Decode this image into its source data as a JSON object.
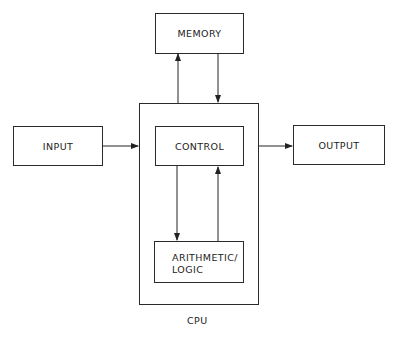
{
  "diagram": {
    "type": "block-diagram",
    "nodes": {
      "memory": {
        "label": "MEMORY"
      },
      "input": {
        "label": "INPUT"
      },
      "control": {
        "label": "CONTROL"
      },
      "output": {
        "label": "OUTPUT"
      },
      "alu": {
        "label_line1": "ARITHMETIC/",
        "label_line2": "LOGIC"
      },
      "cpu": {
        "label": "CPU"
      }
    },
    "edges": [
      {
        "from": "input",
        "to": "cpu"
      },
      {
        "from": "cpu",
        "to": "output"
      },
      {
        "from": "cpu",
        "to": "memory"
      },
      {
        "from": "memory",
        "to": "cpu"
      },
      {
        "from": "control",
        "to": "alu"
      },
      {
        "from": "alu",
        "to": "control"
      }
    ]
  }
}
